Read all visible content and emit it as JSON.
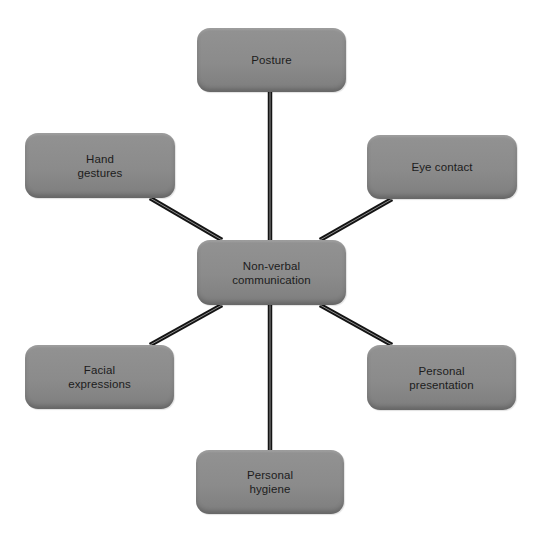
{
  "diagram": {
    "type": "mind-map",
    "center": {
      "id": "center",
      "label": "Non-verbal\ncommunication",
      "box": {
        "x": 197,
        "y": 240,
        "w": 149,
        "h": 65
      }
    },
    "nodes": [
      {
        "id": "posture",
        "label": "Posture",
        "box": {
          "x": 197,
          "y": 28,
          "w": 149,
          "h": 64
        }
      },
      {
        "id": "hand-gestures",
        "label": "Hand\ngestures",
        "box": {
          "x": 25,
          "y": 133,
          "w": 150,
          "h": 65
        }
      },
      {
        "id": "eye-contact",
        "label": "Eye contact",
        "box": {
          "x": 367,
          "y": 135,
          "w": 150,
          "h": 64
        }
      },
      {
        "id": "facial-expressions",
        "label": "Facial\nexpressions",
        "box": {
          "x": 25,
          "y": 345,
          "w": 149,
          "h": 64
        }
      },
      {
        "id": "personal-presentation",
        "label": "Personal\npresentation",
        "box": {
          "x": 367,
          "y": 345,
          "w": 149,
          "h": 65
        }
      },
      {
        "id": "personal-hygiene",
        "label": "Personal\nhygiene",
        "box": {
          "x": 196,
          "y": 450,
          "w": 148,
          "h": 64
        }
      }
    ],
    "edges": [
      {
        "from": "center",
        "to": "posture",
        "x1": 270,
        "y1": 240,
        "x2": 270,
        "y2": 92
      },
      {
        "from": "center",
        "to": "hand-gestures",
        "x1": 222,
        "y1": 240,
        "x2": 150,
        "y2": 198
      },
      {
        "from": "center",
        "to": "eye-contact",
        "x1": 320,
        "y1": 240,
        "x2": 392,
        "y2": 199
      },
      {
        "from": "center",
        "to": "facial-expressions",
        "x1": 222,
        "y1": 305,
        "x2": 150,
        "y2": 345
      },
      {
        "from": "center",
        "to": "personal-presentation",
        "x1": 320,
        "y1": 305,
        "x2": 392,
        "y2": 345
      },
      {
        "from": "center",
        "to": "personal-hygiene",
        "x1": 270,
        "y1": 305,
        "x2": 270,
        "y2": 450
      }
    ],
    "colors": {
      "node_fill": "#8b8b8b",
      "node_text": "#1c1c1c",
      "edge_outer": "#141414",
      "edge_inner": "#9a9a9a",
      "background": "#ffffff"
    }
  }
}
